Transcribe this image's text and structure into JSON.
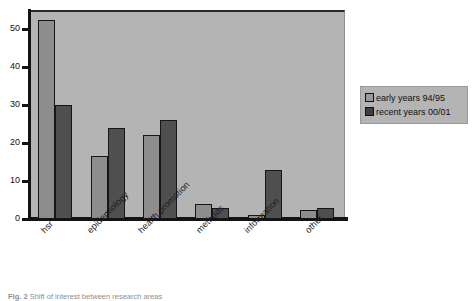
{
  "chart_data": {
    "type": "bar",
    "title": "",
    "subtitle": "",
    "xlabel": "",
    "ylabel": "",
    "ylim": [
      0,
      55
    ],
    "yticks": [
      0,
      10,
      20,
      30,
      40,
      50
    ],
    "ytick_labels": [
      "0",
      "10",
      "20",
      "30",
      "40",
      "50"
    ],
    "grid": false,
    "legend_position": "right",
    "categories": [
      "hsr",
      "epidemiology",
      "health promotion",
      "methods",
      "information",
      "other"
    ],
    "series": [
      {
        "name": "early years 94/95",
        "color": "#8d8d8d",
        "values": [
          52.5,
          16.5,
          22,
          4,
          1,
          2.5
        ]
      },
      {
        "name": "recent years 00/01",
        "color": "#4f4f4f",
        "values": [
          30,
          24,
          26,
          3,
          13,
          3
        ]
      }
    ]
  },
  "legend": {
    "items": [
      {
        "label": "early years 94/95",
        "swatch": "early"
      },
      {
        "label": "recent years 00/01",
        "swatch": "recent"
      }
    ]
  },
  "caption": {
    "label": "Fig. 2",
    "text": "Shift of interest between research areas"
  },
  "colors": {
    "plot_background": "#b4b4b4",
    "early_bar": "#8d8d8d",
    "recent_bar": "#4f4f4f",
    "axis": "#131313",
    "page_background": "#ffffff"
  }
}
